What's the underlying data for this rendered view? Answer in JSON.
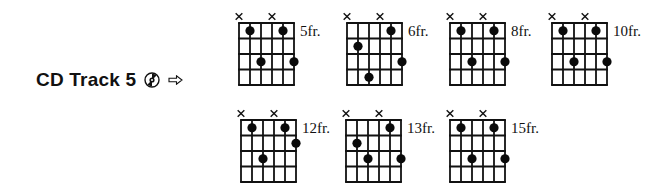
{
  "track": {
    "label": "CD Track 5",
    "cd_icon": "cd-disc-icon",
    "arrow_icon": "right-arrow-outline-icon"
  },
  "diagram_spec": {
    "strings": 6,
    "frets": 4,
    "muted_strings": [
      1,
      4
    ]
  },
  "diagrams": [
    {
      "position": "5fr.",
      "x": 239,
      "y": 23,
      "dots": [
        [
          2,
          1
        ],
        [
          5,
          1
        ],
        [
          3,
          3
        ],
        [
          6,
          3
        ]
      ]
    },
    {
      "position": "6fr.",
      "x": 347,
      "y": 23,
      "dots": [
        [
          5,
          1
        ],
        [
          2,
          2
        ],
        [
          6,
          3
        ],
        [
          3,
          4
        ]
      ]
    },
    {
      "position": "8fr.",
      "x": 450,
      "y": 23,
      "dots": [
        [
          2,
          1
        ],
        [
          5,
          1
        ],
        [
          3,
          3
        ],
        [
          6,
          3
        ]
      ]
    },
    {
      "position": "10fr.",
      "x": 552,
      "y": 23,
      "dots": [
        [
          2,
          1
        ],
        [
          5,
          1
        ],
        [
          3,
          3
        ],
        [
          6,
          3
        ]
      ]
    },
    {
      "position": "12fr.",
      "x": 241,
      "y": 120,
      "dots": [
        [
          2,
          1
        ],
        [
          5,
          1
        ],
        [
          6,
          2
        ],
        [
          3,
          3
        ]
      ]
    },
    {
      "position": "13fr.",
      "x": 346,
      "y": 120,
      "dots": [
        [
          5,
          1
        ],
        [
          2,
          2
        ],
        [
          3,
          3
        ],
        [
          6,
          3
        ]
      ]
    },
    {
      "position": "15fr.",
      "x": 450,
      "y": 120,
      "dots": [
        [
          2,
          1
        ],
        [
          5,
          1
        ],
        [
          3,
          3
        ],
        [
          6,
          3
        ]
      ]
    }
  ]
}
